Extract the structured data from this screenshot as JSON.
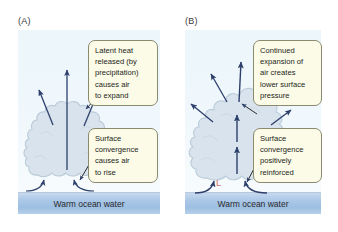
{
  "figure": {
    "title_visible": false,
    "background_color": "#ffffff"
  },
  "colors": {
    "sky": "#edf6fb",
    "ocean": "#a9c6e6",
    "cloud": "#d6e2ec",
    "cloud_outline": "#b9cbd9",
    "arrow": "#2d3f6b",
    "callout_fill": "#fbfbe8",
    "callout_border": "#8a8a6e",
    "low_pressure": "#d9776b",
    "text": "#1d1d20"
  },
  "panels": [
    {
      "key": "a",
      "label": "(A)",
      "ocean_label": "Warm ocean water",
      "low_pressure_mark": null,
      "callouts": [
        {
          "name": "latent-heat-callout",
          "lines": [
            "Latent heat",
            "released (by",
            "precipitation)",
            "causes air",
            "to expand"
          ]
        },
        {
          "name": "surface-convergence-callout",
          "lines": [
            "Surface",
            "convergence",
            "causes air",
            "to rise"
          ]
        }
      ]
    },
    {
      "key": "b",
      "label": "(B)",
      "ocean_label": "Warm ocean water",
      "low_pressure_mark": "L",
      "callouts": [
        {
          "name": "continued-expansion-callout",
          "lines": [
            "Continued",
            "expansion of",
            "air creates",
            "lower surface",
            "pressure"
          ]
        },
        {
          "name": "positively-reinforced-callout",
          "lines": [
            "Surface",
            "convergence",
            "positively",
            "reinforced"
          ]
        }
      ]
    }
  ]
}
